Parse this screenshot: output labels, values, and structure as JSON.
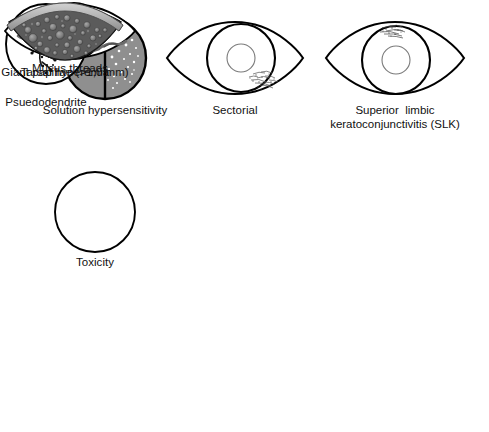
{
  "figure": {
    "background_color": "#ffffff",
    "ink_color": "#000000",
    "rows": 3,
    "columns": 3
  },
  "panels": [
    {
      "id": "solution-hypersensitivity",
      "caption": "Solution hypersensitivity",
      "caption_lines": [
        "Solution hypersensitivity"
      ],
      "art_type": "cornea-circle-split-stained",
      "description": "Filled gray cornea circle divided by a vertical midline with diffuse white punctate speckles",
      "fill_color": "#8f8f8f",
      "outline_color": "#000000",
      "speckle_color": "#ffffff",
      "row": 1,
      "column": 1
    },
    {
      "id": "sectorial",
      "caption": "Sectorial",
      "caption_lines": [
        "Sectorial"
      ],
      "art_type": "eye-outline-with-sector-stipple",
      "description": "Eye almond outline with iris ring and pupil ring, fine stippling over the inferotemporal sector",
      "fill_color": "#ffffff",
      "outline_color": "#000000",
      "stipple_color": "#555555",
      "row": 1,
      "column": 2
    },
    {
      "id": "superior-limbic-keratoconjunctivitis",
      "caption": "Superior  limbic keratoconjunctivitis (SLK)",
      "caption_lines": [
        "Superior  limbic",
        "keratoconjunctivitis (SLK)"
      ],
      "art_type": "eye-outline-with-superior-stipple",
      "description": "Eye almond outline with iris ring and pupil ring, fine hatching at the superior limbus",
      "fill_color": "#ffffff",
      "outline_color": "#000000",
      "stipple_color": "#555555",
      "row": 1,
      "column": 3
    },
    {
      "id": "toxicity",
      "caption": "Toxicity",
      "caption_lines": [
        "Toxicity"
      ],
      "art_type": "cornea-circle-empty",
      "description": "Plain unfilled cornea circle outline",
      "fill_color": "#ffffff",
      "outline_color": "#000000",
      "row": 2,
      "column": 1
    },
    {
      "id": "psuedodendrite",
      "caption": "Psuedodendrite",
      "caption_lines": [
        "Psuedodendrite"
      ],
      "art_type": "cornea-circle-with-dendrite",
      "description": "Cornea circle outline containing a stippled branching dendritic lesion",
      "fill_color": "#ffffff",
      "outline_color": "#000000",
      "lesion_color": "#1a1a1a",
      "row": 2,
      "column": 2
    },
    {
      "id": "mucus-threads",
      "caption": "Mucus threads",
      "caption_lines": [
        "Mucus threads"
      ],
      "art_type": "eye-outline-with-threads",
      "description": "Eye almond outline with offset cornea circle and several gray wavy mucus strands",
      "fill_color": "#ffffff",
      "outline_color": "#000000",
      "thread_color": "#6b6b6b",
      "row": 3,
      "column": 1
    },
    {
      "id": "tarsal-hyperemia",
      "caption": "Tarsal hyperemia",
      "caption_lines": [
        "Tarsal hyperemia"
      ],
      "art_type": "everted-lid-dark-gradient",
      "description": "Everted upper eyelid lens shape with light gray lash margin band and dark hyperemic tarsal conjunctiva",
      "rim_color": "#b4b4b4",
      "fill_color": "#3a3a3a",
      "core_color": "#1a1a1a",
      "outline_color": "#000000",
      "row": 3,
      "column": 2
    },
    {
      "id": "giant-papillae",
      "caption": "Giant papillae (>1,0 mm)",
      "caption_lines": [
        "Giant papillae (>1,0 mm)"
      ],
      "art_type": "everted-lid-with-papillae",
      "description": "Everted upper eyelid lens shape with gray tarsal surface studded with rounded giant papillae",
      "rim_color": "#b4b4b4",
      "fill_color": "#5e5e5e",
      "papilla_color": "#8a8a8a",
      "outline_color": "#000000",
      "size_threshold": ">1,0 mm",
      "row": 3,
      "column": 3
    }
  ]
}
